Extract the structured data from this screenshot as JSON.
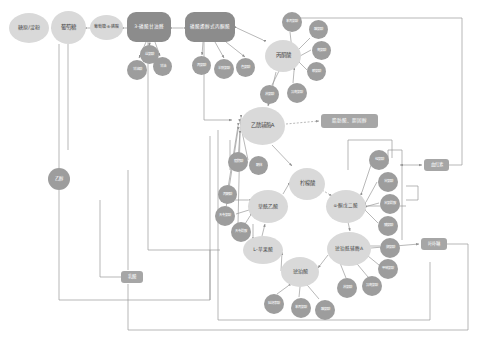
{
  "diagram": {
    "type": "metabolic-pathway-network",
    "colors": {
      "major_node": "#d9d9d9",
      "major_text": "#4a4a4a",
      "pill_node": "#8c8c8c",
      "satellite_node": "#9d9d9d",
      "box_node": "#a6a6a6",
      "edge": "#9a9a9a",
      "background": "#ffffff"
    }
  },
  "glycolysis_chain": [
    {
      "id": "g1",
      "label": "糖原/淀粉",
      "shape": "circle"
    },
    {
      "id": "g2",
      "label": "葡萄糖",
      "shape": "circle"
    },
    {
      "id": "g3",
      "label": "葡萄糖-6-磷酸",
      "shape": "circle"
    },
    {
      "id": "g4",
      "label": "3-磷酸甘油醛",
      "shape": "pill"
    },
    {
      "id": "g5",
      "label": "磷酸烯醇式丙酮酸",
      "shape": "pill"
    }
  ],
  "major_nodes": [
    {
      "id": "pyr",
      "label": "丙酮酸"
    },
    {
      "id": "accoa",
      "label": "乙酰辅酶A"
    },
    {
      "id": "cit",
      "label": "柠檬酸"
    },
    {
      "id": "akg",
      "label": "α-酮戊二酸"
    },
    {
      "id": "oaa",
      "label": "草酰乙酸"
    },
    {
      "id": "mal",
      "label": "L-苹果酸"
    },
    {
      "id": "sca",
      "label": "琥珀酰辅酶A"
    },
    {
      "id": "suc",
      "label": "琥珀酸"
    }
  ],
  "product_boxes": [
    {
      "id": "fatchol",
      "label": "脂肪酸、胆固醇"
    },
    {
      "id": "heme",
      "label": "血红素"
    },
    {
      "id": "porph",
      "label": "叶卟啉"
    },
    {
      "id": "lactate",
      "label": "乳酸"
    },
    {
      "id": "ethanol",
      "label": "乙醇"
    }
  ],
  "satellites": {
    "from_g4": [
      "丝氨酸",
      "甘氨酸",
      "半胱氨酸"
    ],
    "from_g5": [
      "苯丙氨酸",
      "酪氨酸",
      "色氨酸"
    ],
    "to_accoa_top": [
      "亮氨酸",
      "异亮氨酸",
      "赖氨酸",
      "苏氨酸"
    ],
    "to_accoa_left": [
      "脂肪酸",
      "酮体",
      "乙醛",
      "丙酮酸"
    ],
    "to_akg_right": [
      "谷氨酸",
      "谷氨酰胺",
      "脯氨酸",
      "精氨酸",
      "组氨酸"
    ],
    "to_oaa_left": [
      "天冬氨酸",
      "天冬酰胺"
    ],
    "to_sca_right": [
      "缬氨酸",
      "甲硫氨酸",
      "异亮氨酸",
      "苏氨酸"
    ],
    "to_suc_bottom": [
      "苯丙氨酸",
      "酪氨酸",
      "延胡索酸"
    ],
    "to_mal_left": [
      "丙酮酸"
    ]
  },
  "nodes": [
    {
      "id": "g1",
      "label": "糖原/淀粉",
      "cls": "n-major",
      "x": 9,
      "y": 13,
      "w": 40,
      "h": 30,
      "fs": 5.0
    },
    {
      "id": "g2",
      "label": "葡萄糖",
      "cls": "n-major",
      "x": 51,
      "y": 11,
      "w": 35,
      "h": 33,
      "fs": 5.4
    },
    {
      "id": "g3",
      "label": "葡萄糖-6-磷酸",
      "cls": "n-major",
      "x": 90,
      "y": 15,
      "w": 33,
      "h": 25,
      "fs": 4.0
    },
    {
      "id": "g4",
      "label": "3-磷酸甘油醛",
      "cls": "n-pill",
      "x": 127,
      "y": 12,
      "w": 44,
      "h": 30,
      "fs": 4.6
    },
    {
      "id": "g5",
      "label": "磷酸烯醇式丙酮酸",
      "cls": "n-pill",
      "x": 185,
      "y": 12,
      "w": 50,
      "h": 30,
      "fs": 4.6
    },
    {
      "id": "pyr",
      "label": "丙酮酸",
      "cls": "n-major",
      "x": 265,
      "y": 40,
      "w": 36,
      "h": 32,
      "fs": 5.4
    },
    {
      "id": "accoa",
      "label": "乙酰辅酶A",
      "cls": "n-major",
      "x": 240,
      "y": 107,
      "w": 45,
      "h": 38,
      "fs": 5.4
    },
    {
      "id": "cit",
      "label": "柠檬酸",
      "cls": "n-major",
      "x": 289,
      "y": 168,
      "w": 36,
      "h": 32,
      "fs": 5.4
    },
    {
      "id": "akg",
      "label": "α-酮戊二酸",
      "cls": "n-major",
      "x": 326,
      "y": 190,
      "w": 40,
      "h": 33,
      "fs": 4.6
    },
    {
      "id": "oaa",
      "label": "草酰乙酸",
      "cls": "n-major",
      "x": 248,
      "y": 190,
      "w": 40,
      "h": 33,
      "fs": 5.0
    },
    {
      "id": "mal",
      "label": "L-苹果酸",
      "cls": "n-major",
      "x": 243,
      "y": 236,
      "w": 40,
      "h": 28,
      "fs": 4.8
    },
    {
      "id": "sca",
      "label": "琥珀酰辅酶A",
      "cls": "n-major",
      "x": 327,
      "y": 232,
      "w": 44,
      "h": 34,
      "fs": 4.6
    },
    {
      "id": "suc",
      "label": "琥珀酸",
      "cls": "n-major",
      "x": 281,
      "y": 257,
      "w": 38,
      "h": 30,
      "fs": 5.0
    },
    {
      "id": "fatchol",
      "label": "脂肪酸、胆固醇",
      "cls": "n-box",
      "x": 321,
      "y": 114,
      "w": 57,
      "h": 14,
      "fs": 4.6
    },
    {
      "id": "heme",
      "label": "血红素",
      "cls": "n-box",
      "x": 424,
      "y": 159,
      "w": 25,
      "h": 12,
      "fs": 4.4
    },
    {
      "id": "porph",
      "label": "叶卟啉",
      "cls": "n-box",
      "x": 421,
      "y": 238,
      "w": 26,
      "h": 12,
      "fs": 4.4
    },
    {
      "id": "lactate",
      "label": "乳酸",
      "cls": "n-box",
      "x": 121,
      "y": 271,
      "w": 22,
      "h": 12,
      "fs": 4.4
    },
    {
      "id": "ethanol",
      "label": "乙醇",
      "cls": "n-circ",
      "x": 48,
      "y": 168,
      "w": 22,
      "h": 22,
      "fs": 4.4
    },
    {
      "id": "s1",
      "label": "丝氨酸",
      "cls": "n-sat",
      "x": 140,
      "y": 45,
      "w": 19,
      "h": 19,
      "fs": 3.5
    },
    {
      "id": "s2",
      "label": "甘油酸",
      "cls": "n-sat",
      "x": 127,
      "y": 60,
      "w": 20,
      "h": 20,
      "fs": 3.5
    },
    {
      "id": "s3",
      "label": "甘油",
      "cls": "n-sat",
      "x": 153,
      "y": 57,
      "w": 19,
      "h": 19,
      "fs": 3.5
    },
    {
      "id": "s4",
      "label": "丙氨酸",
      "cls": "n-sat",
      "x": 192,
      "y": 56,
      "w": 19,
      "h": 19,
      "fs": 3.5
    },
    {
      "id": "s5",
      "label": "半胱氨酸",
      "cls": "n-sat",
      "x": 214,
      "y": 59,
      "w": 20,
      "h": 20,
      "fs": 3.3
    },
    {
      "id": "s6",
      "label": "色氨酸",
      "cls": "n-sat",
      "x": 236,
      "y": 58,
      "w": 19,
      "h": 19,
      "fs": 3.5
    },
    {
      "id": "s7",
      "label": "苯丙氨酸",
      "cls": "n-sat",
      "x": 282,
      "y": 12,
      "w": 20,
      "h": 20,
      "fs": 3.3
    },
    {
      "id": "s8",
      "label": "酪氨酸",
      "cls": "n-sat",
      "x": 309,
      "y": 20,
      "w": 19,
      "h": 19,
      "fs": 3.5
    },
    {
      "id": "s9",
      "label": "亮氨酸",
      "cls": "n-sat",
      "x": 312,
      "y": 41,
      "w": 19,
      "h": 19,
      "fs": 3.5
    },
    {
      "id": "s10",
      "label": "赖氨酸",
      "cls": "n-sat",
      "x": 307,
      "y": 62,
      "w": 19,
      "h": 19,
      "fs": 3.5
    },
    {
      "id": "s11",
      "label": "异亮氨酸",
      "cls": "n-sat",
      "x": 287,
      "y": 83,
      "w": 20,
      "h": 20,
      "fs": 3.3
    },
    {
      "id": "s12",
      "label": "苏氨酸",
      "cls": "n-sat",
      "x": 260,
      "y": 85,
      "w": 19,
      "h": 19,
      "fs": 3.5
    },
    {
      "id": "s13",
      "label": "脂肪酸",
      "cls": "n-sat",
      "x": 228,
      "y": 152,
      "w": 20,
      "h": 20,
      "fs": 3.5
    },
    {
      "id": "s14",
      "label": "酮体",
      "cls": "n-sat",
      "x": 249,
      "y": 156,
      "w": 19,
      "h": 19,
      "fs": 3.5
    },
    {
      "id": "s15",
      "label": "丙酮酸",
      "cls": "n-sat",
      "x": 218,
      "y": 185,
      "w": 19,
      "h": 19,
      "fs": 3.5
    },
    {
      "id": "s16",
      "label": "天冬氨酸",
      "cls": "n-sat",
      "x": 215,
      "y": 206,
      "w": 20,
      "h": 20,
      "fs": 3.3
    },
    {
      "id": "s17",
      "label": "天冬酰胺",
      "cls": "n-sat",
      "x": 231,
      "y": 222,
      "w": 20,
      "h": 20,
      "fs": 3.3
    },
    {
      "id": "s18",
      "label": "谷氨酸",
      "cls": "n-sat",
      "x": 378,
      "y": 172,
      "w": 20,
      "h": 20,
      "fs": 3.5
    },
    {
      "id": "s19",
      "label": "谷氨酰胺",
      "cls": "n-sat",
      "x": 380,
      "y": 194,
      "w": 20,
      "h": 20,
      "fs": 3.3
    },
    {
      "id": "s20",
      "label": "脯氨酸",
      "cls": "n-sat",
      "x": 378,
      "y": 216,
      "w": 20,
      "h": 20,
      "fs": 3.5
    },
    {
      "id": "s21",
      "label": "组氨酸",
      "cls": "n-sat",
      "x": 369,
      "y": 150,
      "w": 20,
      "h": 20,
      "fs": 3.5
    },
    {
      "id": "s22",
      "label": "缬氨酸",
      "cls": "n-sat",
      "x": 380,
      "y": 238,
      "w": 20,
      "h": 20,
      "fs": 3.5
    },
    {
      "id": "s23",
      "label": "甲硫氨酸",
      "cls": "n-sat",
      "x": 378,
      "y": 259,
      "w": 20,
      "h": 20,
      "fs": 3.3
    },
    {
      "id": "s24",
      "label": "异亮氨酸",
      "cls": "n-sat",
      "x": 362,
      "y": 276,
      "w": 20,
      "h": 20,
      "fs": 3.3
    },
    {
      "id": "s25",
      "label": "苏氨酸",
      "cls": "n-sat",
      "x": 337,
      "y": 278,
      "w": 20,
      "h": 20,
      "fs": 3.5
    },
    {
      "id": "s26",
      "label": "苯丙氨酸",
      "cls": "n-sat",
      "x": 291,
      "y": 298,
      "w": 20,
      "h": 20,
      "fs": 3.3
    },
    {
      "id": "s27",
      "label": "酪氨酸",
      "cls": "n-sat",
      "x": 315,
      "y": 300,
      "w": 20,
      "h": 20,
      "fs": 3.5
    },
    {
      "id": "s28",
      "label": "延胡索酸",
      "cls": "n-sat",
      "x": 264,
      "y": 294,
      "w": 20,
      "h": 20,
      "fs": 3.3
    }
  ],
  "edges": [
    {
      "from": "g2",
      "to": "g1",
      "type": "double"
    },
    {
      "from": "g3",
      "to": "g2",
      "type": "double"
    },
    {
      "from": "g4",
      "to": "g3",
      "type": "double"
    },
    {
      "from": "g5",
      "to": "g4",
      "type": "double"
    },
    {
      "from": "pyr",
      "to": "g5",
      "type": "double"
    }
  ]
}
